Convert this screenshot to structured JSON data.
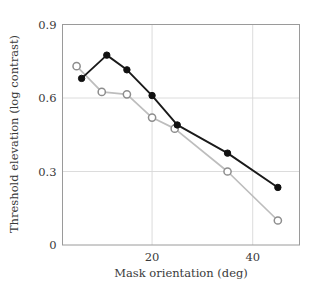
{
  "chart_data": {
    "type": "line",
    "title": "",
    "xlabel": "Mask orientation (deg)",
    "ylabel": "Threshold elevation (log contrast)",
    "xlim": [
      2.2,
      49.3
    ],
    "ylim": [
      0,
      0.9
    ],
    "xticks": [
      20,
      40
    ],
    "xtick_labels": [
      "20",
      "40"
    ],
    "yticks": [
      0,
      0.3,
      0.6,
      0.9
    ],
    "ytick_labels": [
      "0",
      "0.3",
      "0.6",
      "0.9"
    ],
    "grid": "horizontal-at-yticks",
    "legend": "none",
    "series": [
      {
        "name": "filled-circles",
        "marker": "filled-circle",
        "color": "#111111",
        "line_color": "#1a1a1a",
        "x": [
          6,
          11,
          15,
          20,
          25,
          35,
          45
        ],
        "y": [
          0.68,
          0.775,
          0.715,
          0.61,
          0.49,
          0.375,
          0.235
        ]
      },
      {
        "name": "open-circles",
        "marker": "open-circle",
        "color": "#ffffff",
        "line_color": "#bdbdbd",
        "x": [
          5,
          10,
          15,
          20,
          24.5,
          35,
          45
        ],
        "y": [
          0.73,
          0.625,
          0.615,
          0.52,
          0.475,
          0.3,
          0.1
        ]
      }
    ]
  },
  "figure": {
    "background": "#ffffff",
    "frame_color": "#9a9a9a",
    "grid_color": "#d8d8d8",
    "text_color": "#3a3a3a"
  }
}
